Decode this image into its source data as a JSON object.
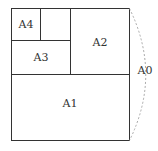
{
  "diagram": {
    "regions": [
      {
        "id": "A0",
        "label": "A0"
      },
      {
        "id": "A1",
        "label": "A1"
      },
      {
        "id": "A2",
        "label": "A2"
      },
      {
        "id": "A3",
        "label": "A3"
      },
      {
        "id": "A4",
        "label": "A4"
      }
    ],
    "colors": {
      "stroke": "#333333",
      "arc": "#aaaaaa",
      "text": "#333333"
    }
  }
}
